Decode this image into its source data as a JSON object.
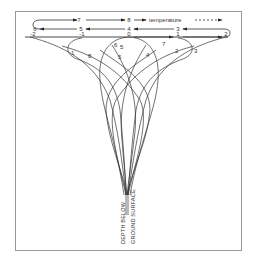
{
  "diagram": {
    "title_label": "temperature",
    "axis_label_line1": "DEPTH BELOW",
    "axis_label_line2": "GROUND SURFACE",
    "top_row": [
      "7",
      "8"
    ],
    "middle_row": [
      "6",
      "5",
      "4",
      "3"
    ],
    "surface_row": [
      "-2",
      "-1",
      "0",
      "1",
      "2"
    ],
    "curve_labels": {
      "left_outer": "1",
      "left_inner": "8",
      "center_a": "6",
      "center_b": "5",
      "center_c": "5",
      "center_d": "4",
      "right_inner": "7",
      "right_mid": "2",
      "right_outer": "3"
    },
    "colors": {
      "line": "#333333",
      "frame": "#9a9a9a",
      "background": "#ffffff"
    }
  }
}
